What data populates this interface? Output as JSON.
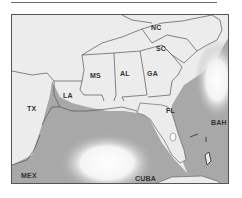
{
  "map": {
    "labels": {
      "nc": "NC",
      "sc": "SC",
      "ga": "GA",
      "al": "AL",
      "ms": "MS",
      "la": "LA",
      "tx": "TX",
      "fl": "FL",
      "bah": "BAH",
      "mex": "MEX",
      "cuba": "CUBA"
    },
    "colors": {
      "land": "#ececec",
      "water": "#a8a8a8",
      "border": "#555555",
      "label": "#333333"
    }
  }
}
